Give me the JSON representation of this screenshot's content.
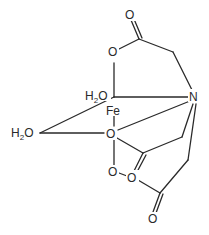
{
  "diagram": {
    "atoms": {
      "fe": "Fe",
      "n": "N",
      "h2o_top": {
        "h": "H",
        "sub": "2",
        "o": "O"
      },
      "h2o_left": {
        "h": "H",
        "sub": "2",
        "o": "O"
      },
      "o_top_carbonyl": "O",
      "o_top_ester": "O",
      "o_center": "O",
      "o_mid_carbonyl": "O",
      "o_lower_left": "O",
      "o_lower": "O",
      "o_bottom_carbonyl": "O"
    },
    "colors": {
      "bond": "#2a2a2a",
      "background": "#ffffff"
    }
  }
}
